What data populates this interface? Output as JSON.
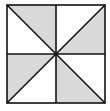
{
  "diagram": {
    "type": "pinwheel-square",
    "square": {
      "x": 7,
      "y": 5,
      "size": 98
    },
    "fill_color": "#d9d9d9",
    "background_color": "#ffffff",
    "line_color": "#111111",
    "shaded_triangles": [
      "top-left-quadrant-upper",
      "top-right-quadrant-lower",
      "bottom-left-quadrant-upper",
      "bottom-right-quadrant-lower"
    ],
    "total_triangles": 8,
    "shaded_count": 4
  }
}
